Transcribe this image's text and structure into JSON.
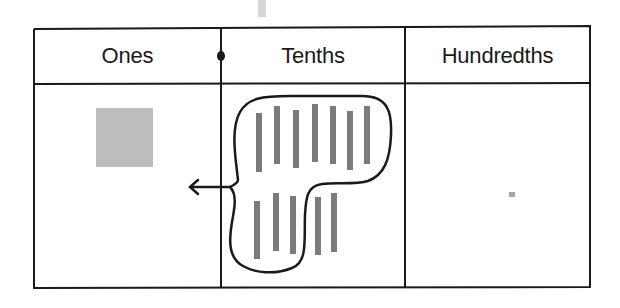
{
  "diagram": {
    "columns": [
      {
        "label": "Ones",
        "count": 1,
        "representation": "square"
      },
      {
        "label": "Tenths",
        "count": 12,
        "representation": "bar"
      },
      {
        "label": "Hundredths",
        "count": 1,
        "representation": "small-square"
      }
    ],
    "decimal_point": {
      "between": [
        "Ones",
        "Tenths"
      ]
    },
    "grouping": {
      "column": "Tenths",
      "grouped_count": 10,
      "remaining_count": 2,
      "arrow_to": "Ones",
      "meaning": "10 tenths regrouped as 1 one"
    },
    "colors": {
      "line": "#1a1a1a",
      "ones_square": "#bdbdbd",
      "tenth_bar": "#7b7b7b",
      "hundredth_square": "#a6a6a6",
      "top_tab": "#d6d6d6"
    }
  }
}
